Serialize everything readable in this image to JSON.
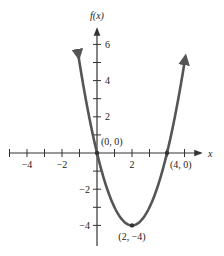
{
  "chart_data": {
    "type": "line",
    "title": "",
    "function": "f(x) = x^2 - 4x",
    "xlabel": "x",
    "ylabel": "f(x)",
    "xlim": [
      -5,
      5.5
    ],
    "ylim": [
      -5,
      7
    ],
    "x_ticks": [
      -5,
      -4,
      -3,
      -2,
      -1,
      1,
      2,
      3,
      4,
      5
    ],
    "x_tick_labels": [
      {
        "value": -4,
        "label": "−4"
      },
      {
        "value": -2,
        "label": "−2"
      },
      {
        "value": 2,
        "label": "2"
      }
    ],
    "y_ticks": [
      -4,
      -3,
      -2,
      -1,
      1,
      2,
      3,
      4,
      5,
      6
    ],
    "y_tick_labels": [
      {
        "value": 6,
        "label": "6"
      },
      {
        "value": 4,
        "label": "4"
      },
      {
        "value": 2,
        "label": "2"
      },
      {
        "value": -2,
        "label": "−2"
      },
      {
        "value": -4,
        "label": "−4"
      }
    ],
    "series": [
      {
        "name": "f(x)",
        "x": [
          -1.05,
          -0.5,
          0,
          0.5,
          1,
          1.5,
          2,
          2.5,
          3,
          3.5,
          4,
          4.5,
          5.05
        ],
        "values": [
          5.3,
          2.25,
          0,
          -1.75,
          -3,
          -3.75,
          -4,
          -3.75,
          -3,
          -1.75,
          0,
          2.25,
          5.3
        ],
        "color": "#555555",
        "arrows_both_ends": true
      }
    ],
    "annotations": [
      {
        "point": [
          0,
          0
        ],
        "label": "(0, 0)"
      },
      {
        "point": [
          4,
          0
        ],
        "label": "(4, 0)"
      },
      {
        "point": [
          2,
          -4
        ],
        "label": "(2, −4)"
      }
    ],
    "grid": false,
    "legend": null
  },
  "colors": {
    "axis": "#333333",
    "curve": "#555555",
    "text": "#222222"
  }
}
